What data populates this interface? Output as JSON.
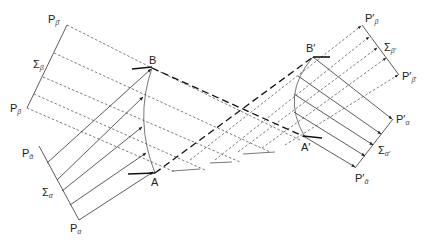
{
  "diagram": {
    "type": "ray-transfer-geometric-optics",
    "left_system": {
      "labels": {
        "P_beta_bar": {
          "main": "P",
          "sub": "β̄",
          "x": 48,
          "y": 23
        },
        "Sigma_beta": {
          "main": "Σ",
          "sub": "β",
          "x": 33,
          "y": 68
        },
        "P_beta": {
          "main": "P",
          "sub": "β",
          "x": 10,
          "y": 112
        },
        "P_alpha_bar": {
          "main": "P",
          "sub": "ᾱ",
          "x": 22,
          "y": 157
        },
        "Sigma_alpha": {
          "main": "Σ",
          "sub": "α",
          "x": 42,
          "y": 196
        },
        "P_alpha": {
          "main": "P",
          "sub": "α",
          "x": 70,
          "y": 232
        }
      },
      "points": {
        "B": {
          "label": "B",
          "x": 152,
          "y": 68
        },
        "A": {
          "label": "A",
          "x": 155,
          "y": 173
        }
      }
    },
    "right_system": {
      "labels": {
        "P_prime_beta": {
          "main": "P′",
          "sub": "β",
          "x": 365,
          "y": 22
        },
        "Sigma_beta_prime": {
          "main": "Σ",
          "sub": "β′",
          "x": 384,
          "y": 51
        },
        "P_prime_beta_bar": {
          "main": "P′",
          "sub": "β̄",
          "x": 402,
          "y": 80
        },
        "P_prime_alpha": {
          "main": "P′",
          "sub": "α",
          "x": 396,
          "y": 123
        },
        "Sigma_alpha_prime": {
          "main": "Σ",
          "sub": "α′",
          "x": 378,
          "y": 154
        },
        "P_prime_alpha_bar": {
          "main": "P′",
          "sub": "ᾱ",
          "x": 355,
          "y": 182
        }
      },
      "points": {
        "B_prime": {
          "label": "B′",
          "x": 313,
          "y": 57
        },
        "A_prime": {
          "label": "A′",
          "x": 305,
          "y": 136
        }
      }
    }
  }
}
